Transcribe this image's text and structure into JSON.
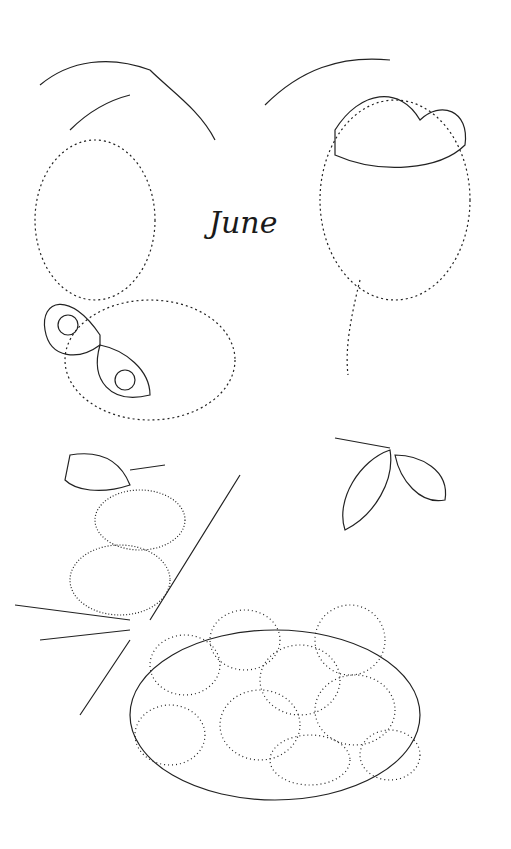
{
  "page": {
    "title": "June"
  },
  "illustration": {
    "elements": [
      {
        "name": "buddleia-flower-spray-left",
        "description": "flowering buddleia spray with leaves, upper left"
      },
      {
        "name": "peacock-butterfly-left",
        "description": "peacock butterfly on buddleia, left"
      },
      {
        "name": "buddleia-flower-spray-right",
        "description": "flowering buddleia spray, upper right"
      },
      {
        "name": "tortoiseshell-butterfly-right",
        "description": "small tortoiseshell butterfly on buddleia, upper right"
      },
      {
        "name": "meadow-brown-butterfly",
        "description": "butterfly with wings open, middle right"
      },
      {
        "name": "small-butterfly-on-thistle",
        "description": "butterfly perched on thistle, left"
      },
      {
        "name": "thistle-heads",
        "description": "spiky thistle heads with leaves, lower left"
      },
      {
        "name": "strawberry-bowl",
        "description": "bowl heaped with strawberries, bottom"
      }
    ]
  }
}
